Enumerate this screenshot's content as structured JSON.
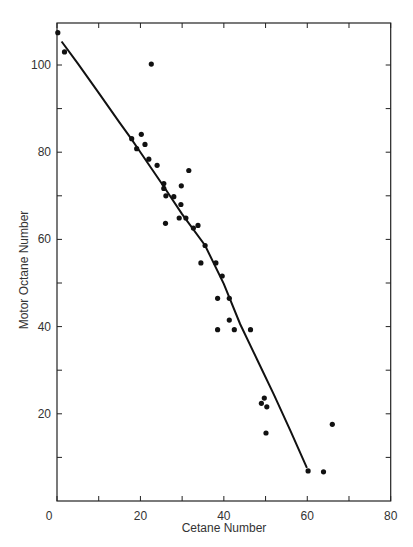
{
  "chart_data": {
    "type": "scatter",
    "title": "",
    "xlabel": "Cetane Number",
    "ylabel": "Motor Octane Number",
    "xlim": [
      0,
      80
    ],
    "ylim": [
      0,
      110
    ],
    "xticks": [
      0,
      10,
      20,
      30,
      40,
      50,
      60,
      70,
      80
    ],
    "xtick_labels": [
      "0",
      "",
      "20",
      "",
      "40",
      "",
      "60",
      "",
      "80"
    ],
    "yticks": [
      0,
      10,
      20,
      30,
      40,
      50,
      60,
      70,
      80,
      90,
      100
    ],
    "ytick_labels": [
      "0",
      "",
      "20",
      "",
      "40",
      "",
      "60",
      "",
      "80",
      "",
      "100"
    ],
    "grid": false,
    "legend": null,
    "series": [
      {
        "name": "Observed fuels",
        "kind": "scatter",
        "points": [
          [
            0.2,
            107.4
          ],
          [
            1.8,
            103.0
          ],
          [
            22.6,
            100.2
          ],
          [
            17.9,
            83.1
          ],
          [
            20.2,
            84.1
          ],
          [
            19.1,
            80.8
          ],
          [
            21.1,
            81.8
          ],
          [
            22.0,
            78.4
          ],
          [
            24.0,
            77.0
          ],
          [
            31.6,
            75.8
          ],
          [
            25.6,
            72.8
          ],
          [
            25.6,
            71.7
          ],
          [
            29.8,
            72.3
          ],
          [
            26.1,
            70.0
          ],
          [
            28.0,
            69.8
          ],
          [
            29.7,
            68.0
          ],
          [
            26.0,
            63.7
          ],
          [
            29.3,
            64.9
          ],
          [
            30.9,
            64.9
          ],
          [
            33.8,
            63.2
          ],
          [
            32.7,
            62.6
          ],
          [
            35.5,
            58.6
          ],
          [
            34.5,
            54.6
          ],
          [
            38.1,
            54.6
          ],
          [
            39.6,
            51.6
          ],
          [
            38.5,
            46.5
          ],
          [
            41.3,
            46.5
          ],
          [
            41.3,
            41.5
          ],
          [
            38.5,
            39.3
          ],
          [
            42.5,
            39.3
          ],
          [
            46.4,
            39.3
          ],
          [
            49.7,
            23.6
          ],
          [
            49.0,
            22.4
          ],
          [
            50.3,
            21.6
          ],
          [
            50.1,
            15.6
          ],
          [
            60.2,
            6.9
          ],
          [
            63.9,
            6.7
          ],
          [
            66.0,
            17.6
          ]
        ]
      },
      {
        "name": "Fitted curve",
        "kind": "line",
        "points": [
          [
            1.1,
            105.4
          ],
          [
            5.0,
            100.3
          ],
          [
            10.0,
            93.6
          ],
          [
            15.0,
            86.8
          ],
          [
            17.7,
            83.2
          ],
          [
            20.0,
            80.0
          ],
          [
            25.4,
            72.4
          ],
          [
            30.0,
            65.8
          ],
          [
            35.5,
            58.6
          ],
          [
            40.0,
            49.8
          ],
          [
            43.9,
            40.6
          ],
          [
            48.0,
            32.4
          ],
          [
            52.0,
            24.4
          ],
          [
            56.0,
            16.0
          ],
          [
            59.9,
            7.6
          ]
        ]
      }
    ]
  },
  "layout": {
    "plot": {
      "left": 57,
      "right": 390.7,
      "top": 23,
      "bottom": 501
    }
  }
}
